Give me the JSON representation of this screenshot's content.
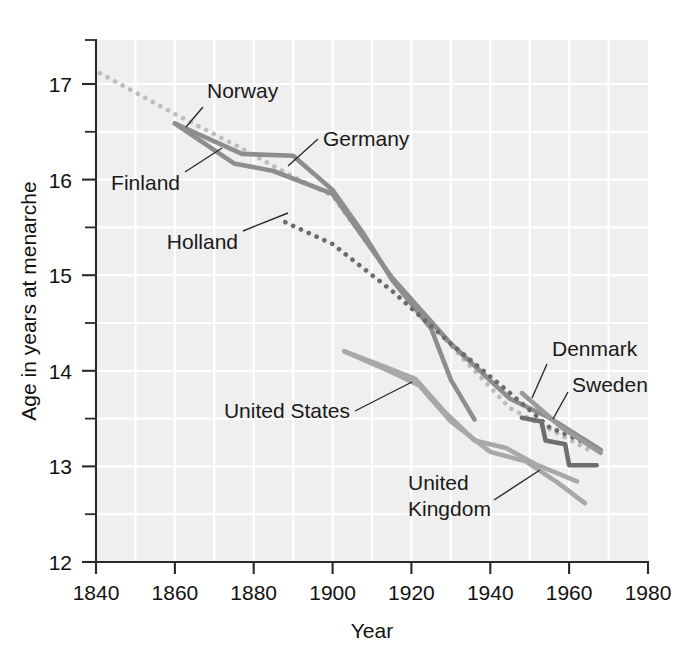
{
  "chart_data": {
    "type": "line",
    "title": "",
    "xlabel": "Year",
    "ylabel": "Age in years at menarche",
    "xlim": [
      1840,
      1980
    ],
    "ylim": [
      12,
      17.5
    ],
    "xticks": [
      1840,
      1860,
      1880,
      1900,
      1920,
      1940,
      1960,
      1980
    ],
    "yticks": [
      12,
      13,
      14,
      15,
      16,
      17
    ],
    "y_minor_ticks": [
      12.5,
      13.5,
      14.5,
      15.5,
      16.5,
      17.5
    ],
    "grid": "light-gray-panel-with-white-gridlines",
    "legend_position": "inline-annotations",
    "series": [
      {
        "name": "Norway",
        "style": "dotted",
        "color": "#bdbdbd",
        "points": [
          [
            1841,
            17.15
          ],
          [
            1860,
            16.72
          ],
          [
            1875,
            16.4
          ],
          [
            1890,
            16.06
          ],
          [
            1900,
            15.86
          ],
          [
            1915,
            15.0
          ],
          [
            1930,
            14.28
          ],
          [
            1945,
            13.62
          ],
          [
            1955,
            13.4
          ],
          [
            1965,
            13.18
          ]
        ]
      },
      {
        "name": "Finland",
        "style": "solid",
        "color": "#8e8e8e",
        "points": [
          [
            1860,
            16.62
          ],
          [
            1875,
            16.2
          ],
          [
            1885,
            16.12
          ],
          [
            1900,
            15.88
          ],
          [
            1915,
            15.0
          ],
          [
            1930,
            14.3
          ],
          [
            1945,
            13.72
          ],
          [
            1955,
            13.52
          ],
          [
            1968,
            13.18
          ]
        ]
      },
      {
        "name": "Germany",
        "style": "solid",
        "color": "#8e8e8e",
        "points": [
          [
            1860,
            16.62
          ],
          [
            1877,
            16.3
          ],
          [
            1890,
            16.28
          ],
          [
            1900,
            15.92
          ],
          [
            1908,
            15.45
          ],
          [
            1915,
            14.98
          ],
          [
            1925,
            14.46
          ],
          [
            1930,
            13.92
          ],
          [
            1936,
            13.5
          ]
        ]
      },
      {
        "name": "Holland",
        "style": "dotted",
        "color": "#6b6b6b",
        "points": [
          [
            1888,
            15.58
          ],
          [
            1900,
            15.35
          ],
          [
            1915,
            14.86
          ],
          [
            1930,
            14.3
          ],
          [
            1945,
            13.78
          ],
          [
            1955,
            13.42
          ],
          [
            1966,
            13.22
          ]
        ]
      },
      {
        "name": "United States",
        "style": "solid",
        "color": "#a8a8a8",
        "points": [
          [
            1903,
            14.22
          ],
          [
            1915,
            14.0
          ],
          [
            1922,
            13.85
          ],
          [
            1930,
            13.5
          ],
          [
            1940,
            13.18
          ],
          [
            1948,
            13.08
          ],
          [
            1956,
            12.86
          ],
          [
            1964,
            12.62
          ]
        ]
      },
      {
        "name": "United Kingdom",
        "style": "solid",
        "color": "#a8a8a8",
        "points": [
          [
            1903,
            14.22
          ],
          [
            1915,
            14.0
          ],
          [
            1922,
            13.85
          ],
          [
            1930,
            13.5
          ],
          [
            1940,
            13.18
          ],
          [
            1948,
            13.08
          ],
          [
            1956,
            12.86
          ],
          [
            1964,
            12.62
          ]
        ]
      },
      {
        "name": "Denmark",
        "style": "solid",
        "color": "#9a9a9a",
        "points": [
          [
            1948,
            13.78
          ],
          [
            1958,
            13.42
          ],
          [
            1968,
            13.15
          ]
        ]
      },
      {
        "name": "Sweden",
        "style": "solid",
        "color": "#6e6e6e",
        "points": [
          [
            1948,
            13.52
          ],
          [
            1953,
            13.48
          ],
          [
            1954,
            13.28
          ],
          [
            1959,
            13.24
          ],
          [
            1960,
            13.02
          ],
          [
            1967,
            13.02
          ]
        ]
      }
    ],
    "annotations": [
      {
        "label": "Norway",
        "target_series": "Norway"
      },
      {
        "label": "Germany",
        "target_series": "Germany"
      },
      {
        "label": "Finland",
        "target_series": "Finland"
      },
      {
        "label": "Holland",
        "target_series": "Holland"
      },
      {
        "label": "United States",
        "target_series": "United States"
      },
      {
        "label": "United\nKingdom",
        "target_series": "United Kingdom"
      },
      {
        "label": "Denmark",
        "target_series": "Denmark"
      },
      {
        "label": "Sweden",
        "target_series": "Sweden"
      }
    ]
  },
  "axes": {
    "y_tick_labels": [
      "17",
      "16",
      "15",
      "14",
      "13",
      "12"
    ],
    "x_tick_labels": [
      "1840",
      "1860",
      "1880",
      "1900",
      "1920",
      "1940",
      "1960",
      "1980"
    ],
    "x_axis_title": "Year",
    "y_axis_title": "Age in years at menarche"
  },
  "labels": {
    "norway": "Norway",
    "germany": "Germany",
    "finland": "Finland",
    "holland": "Holland",
    "united_states": "United States",
    "united_kingdom_line1": "United",
    "united_kingdom_line2": "Kingdom",
    "denmark": "Denmark",
    "sweden": "Sweden"
  },
  "colors": {
    "panel_background": "#efefef",
    "gridline": "#ffffff",
    "axis": "#2a2a2a",
    "text": "#111111",
    "norway": "#bdbdbd",
    "finland": "#8e8e8e",
    "germany": "#8e8e8e",
    "holland": "#6b6b6b",
    "united_states": "#a8a8a8",
    "united_kingdom": "#a8a8a8",
    "denmark": "#9a9a9a",
    "sweden": "#6e6e6e"
  }
}
